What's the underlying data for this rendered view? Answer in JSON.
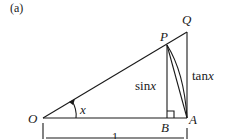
{
  "figure": {
    "panel_label": "(a)",
    "points": {
      "O": "O",
      "A": "A",
      "B": "B",
      "P": "P",
      "Q": "Q"
    },
    "labels": {
      "angle": "x",
      "sin": "sin",
      "sin_var": "x",
      "tan": "tan",
      "tan_var": "x",
      "base_length": "1"
    },
    "colors": {
      "line": "#1a1a1a",
      "background": "#ffffff"
    }
  }
}
